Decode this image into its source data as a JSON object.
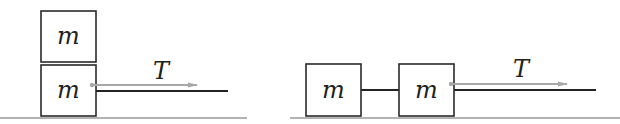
{
  "diagram": {
    "colors": {
      "box_stroke": "#2a2a2a",
      "rope": "#222222",
      "floor": "#9a9a9a",
      "arrow": "#a8a8a8",
      "text": "#222222",
      "background": "#ffffff"
    },
    "left_panel": {
      "description": "Two stacked blocks of mass m on a floor; the lower block is pulled by a rope with tension T",
      "top_block": {
        "label": "m"
      },
      "bottom_block": {
        "label": "m"
      },
      "force_label": "T"
    },
    "right_panel": {
      "description": "Two blocks of mass m side by side, connected by a rope; the right block is pulled by a rope with tension T",
      "left_block": {
        "label": "m"
      },
      "right_block": {
        "label": "m"
      },
      "force_label": "T"
    }
  }
}
